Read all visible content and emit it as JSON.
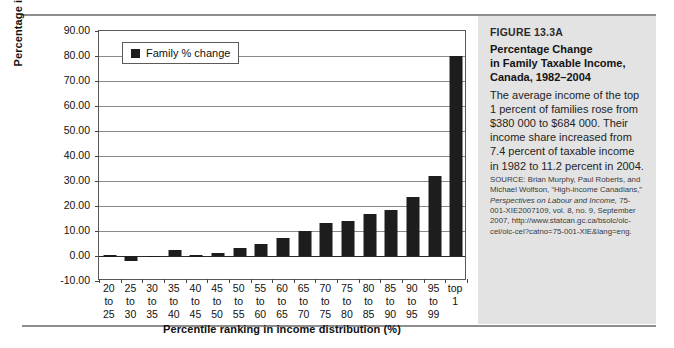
{
  "chart_data": {
    "type": "bar",
    "title": "",
    "xlabel": "Percentile ranking in income distribution (%)",
    "ylabel": "Percentage increase in income (%)",
    "ylim": [
      -10,
      90
    ],
    "ytick_step": 10,
    "ytick_labels": [
      "90.00",
      "80.00",
      "70.00",
      "60.00",
      "50.00",
      "40.00",
      "30.00",
      "20.00",
      "10.00",
      "0.00",
      "-10.00"
    ],
    "grid": true,
    "legend_position": "upper-left",
    "series": [
      {
        "name": "Family % change",
        "color": "#1d1d1d",
        "values": [
          0.3,
          -2.0,
          0.1,
          2.3,
          0.4,
          1.4,
          3.1,
          5.0,
          7.1,
          10.2,
          13.3,
          14.0,
          16.7,
          18.5,
          23.5,
          32.0,
          80.0
        ]
      }
    ],
    "categories": [
      "20 to 25",
      "25 to 30",
      "30 to 35",
      "35 to 40",
      "40 to 45",
      "45 to 50",
      "50 to 55",
      "55 to 60",
      "60 to 65",
      "65 to 70",
      "70 to 75",
      "75 to 80",
      "80 to 85",
      "85 to 90",
      "90 to 95",
      "95 to 99",
      "top 1"
    ],
    "category_lines": [
      [
        "20",
        "to",
        "25"
      ],
      [
        "25",
        "to",
        "30"
      ],
      [
        "30",
        "to",
        "35"
      ],
      [
        "35",
        "to",
        "40"
      ],
      [
        "40",
        "to",
        "45"
      ],
      [
        "45",
        "to",
        "50"
      ],
      [
        "50",
        "to",
        "55"
      ],
      [
        "55",
        "to",
        "60"
      ],
      [
        "60",
        "to",
        "65"
      ],
      [
        "65",
        "to",
        "70"
      ],
      [
        "70",
        "to",
        "75"
      ],
      [
        "75",
        "to",
        "80"
      ],
      [
        "80",
        "to",
        "85"
      ],
      [
        "85",
        "to",
        "90"
      ],
      [
        "90",
        "to",
        "95"
      ],
      [
        "95",
        "to",
        "99"
      ],
      [
        "top",
        "1",
        ""
      ]
    ]
  },
  "legend": {
    "label": "Family % change"
  },
  "sidebar": {
    "figure_label": "FIGURE 13.3A",
    "title_lines": [
      "Percentage Change",
      "in Family Taxable Income,",
      "Canada, 1982–2004"
    ],
    "body": "The average income of the top 1 percent of families rose from $380 000 to $684 000. Their income share increased from 7.4 percent of taxable income in 1982 to 11.2 percent in 2004.",
    "source_prefix": "SOURCE: Brian Murphy, Paul Roberts, and Michael Wolfson, “High-income Canadians,” ",
    "source_italic": "Perspectives on Labour and Income,",
    "source_suffix": " 75-001-XIE2007109, vol. 8, no. 9, September 2007, http://www.statcan.gc.ca/bsolc/olc-cel/olc-cel?catno=75-001-XIE&lang=eng."
  }
}
